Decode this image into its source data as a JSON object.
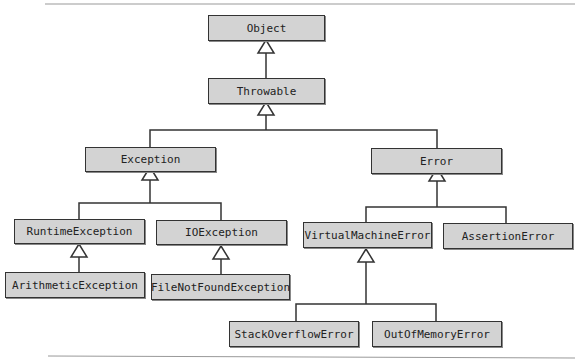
{
  "diagram": {
    "type": "class-hierarchy",
    "nodes": {
      "object": "Object",
      "throwable": "Throwable",
      "exception": "Exception",
      "error": "Error",
      "runtime_exception": "RuntimeException",
      "io_exception": "IOException",
      "arithmetic_exception": "ArithmeticException",
      "file_not_found_exception": "FileNotFoundException",
      "virtual_machine_error": "VirtualMachineError",
      "assertion_error": "AssertionError",
      "stack_overflow_error": "StackOverflowError",
      "out_of_memory_error": "OutOfMemoryError"
    },
    "edges": [
      [
        "Throwable",
        "Object"
      ],
      [
        "Exception",
        "Throwable"
      ],
      [
        "Error",
        "Throwable"
      ],
      [
        "RuntimeException",
        "Exception"
      ],
      [
        "IOException",
        "Exception"
      ],
      [
        "ArithmeticException",
        "RuntimeException"
      ],
      [
        "FileNotFoundException",
        "IOException"
      ],
      [
        "VirtualMachineError",
        "Error"
      ],
      [
        "AssertionError",
        "Error"
      ],
      [
        "StackOverflowError",
        "VirtualMachineError"
      ],
      [
        "OutOfMemoryError",
        "VirtualMachineError"
      ]
    ],
    "colors": {
      "box_fill": "#d3d3d3",
      "stroke": "#333333"
    }
  }
}
